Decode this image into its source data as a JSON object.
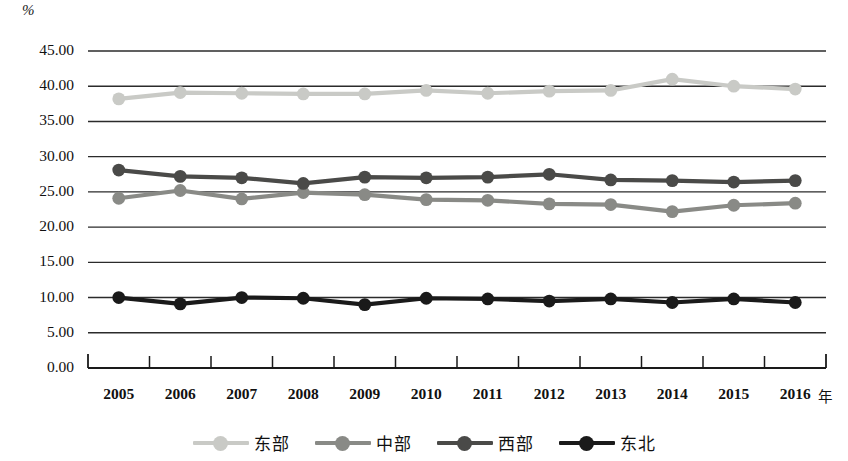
{
  "chart_data": {
    "type": "line",
    "title": "",
    "xlabel": "年",
    "ylabel": "%",
    "unit_label": "%",
    "grid": true,
    "legend_position": "bottom",
    "ylim": [
      0,
      45
    ],
    "y_ticks": [
      "0.00",
      "5.00",
      "10.00",
      "15.00",
      "20.00",
      "25.00",
      "30.00",
      "35.00",
      "40.00",
      "45.00"
    ],
    "y_tick_values": [
      0,
      5,
      10,
      15,
      20,
      25,
      30,
      35,
      40,
      45
    ],
    "categories": [
      "2005",
      "2006",
      "2007",
      "2008",
      "2009",
      "2010",
      "2011",
      "2012",
      "2013",
      "2014",
      "2015",
      "2016"
    ],
    "series": [
      {
        "name": "东部",
        "color": "#c9cac6",
        "values": [
          38.2,
          39.1,
          39.0,
          38.9,
          38.9,
          39.4,
          39.0,
          39.3,
          39.4,
          41.0,
          40.0,
          39.6
        ]
      },
      {
        "name": "中部",
        "color": "#898a86",
        "values": [
          24.1,
          25.2,
          24.0,
          24.9,
          24.6,
          23.9,
          23.8,
          23.3,
          23.2,
          22.2,
          23.1,
          23.4
        ]
      },
      {
        "name": "西部",
        "color": "#4a4a48",
        "values": [
          28.1,
          27.2,
          27.0,
          26.2,
          27.1,
          27.0,
          27.1,
          27.5,
          26.7,
          26.6,
          26.4,
          26.6
        ]
      },
      {
        "name": "东北",
        "color": "#1a1a1a",
        "values": [
          10.0,
          9.1,
          10.0,
          9.9,
          9.0,
          9.9,
          9.8,
          9.5,
          9.8,
          9.3,
          9.8,
          9.3
        ]
      }
    ]
  },
  "legend": {
    "items": [
      {
        "label": "东部",
        "color": "#c9cac6"
      },
      {
        "label": "中部",
        "color": "#898a86"
      },
      {
        "label": "西部",
        "color": "#4a4a48"
      },
      {
        "label": "东北",
        "color": "#1a1a1a"
      }
    ]
  },
  "axes": {
    "x_unit": "年",
    "y_unit": "%"
  }
}
